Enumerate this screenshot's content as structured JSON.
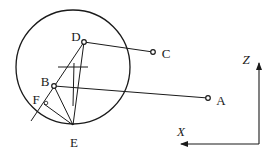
{
  "diagram": {
    "type": "geometry-construction",
    "stroke_color": "#1a1a1a",
    "background": "#ffffff",
    "circle": {
      "cx": 73,
      "cy": 67,
      "r": 57
    },
    "points": {
      "A": {
        "label": "A",
        "x": 208,
        "y": 98,
        "label_x": 221,
        "label_y": 100
      },
      "B": {
        "label": "B",
        "x": 54,
        "y": 86,
        "label_x": 45,
        "label_y": 81
      },
      "C": {
        "label": "C",
        "x": 153,
        "y": 52,
        "label_x": 166,
        "label_y": 53
      },
      "D": {
        "label": "D",
        "x": 84,
        "y": 42,
        "label_x": 76,
        "label_y": 36
      },
      "E": {
        "label": "E",
        "x": 73,
        "y": 125,
        "label_x": 74,
        "label_y": 142
      },
      "F": {
        "label": "F",
        "x": 44,
        "y": 104,
        "label_x": 36,
        "label_y": 99
      }
    },
    "axes": {
      "origin": {
        "x": 259,
        "y": 144
      },
      "z": {
        "label": "Z",
        "end_x": 259,
        "end_y": 62,
        "label_x": 246,
        "label_y": 59
      },
      "x": {
        "label": "X",
        "end_x": 180,
        "end_y": 144,
        "label_x": 181,
        "label_y": 131
      }
    }
  }
}
